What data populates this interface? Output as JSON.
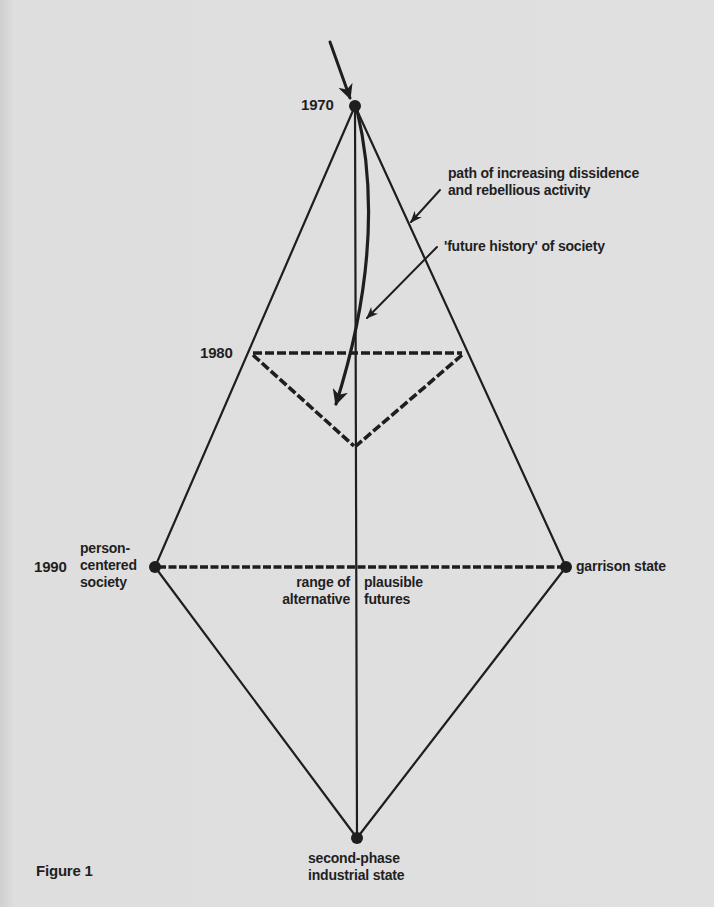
{
  "figure": {
    "caption": "Figure 1",
    "years": {
      "y1970": "1970",
      "y1980": "1980",
      "y1990": "1990"
    },
    "annotations": {
      "dissidence_line1": "path of increasing dissidence",
      "dissidence_line2": "and rebellious activity",
      "future_history": "'future history' of society",
      "person_centered_line1": "person-",
      "person_centered_line2": "centered",
      "person_centered_line3": "society",
      "garrison_state": "garrison state",
      "range_left_line1": "range of",
      "range_left_line2": "alternative",
      "range_right_line1": "plausible",
      "range_right_line2": "futures",
      "bottom_line1": "second-phase",
      "bottom_line2": "industrial state"
    },
    "colors": {
      "ink": "#1e1e1e",
      "paper": "#e0e0e0"
    }
  }
}
